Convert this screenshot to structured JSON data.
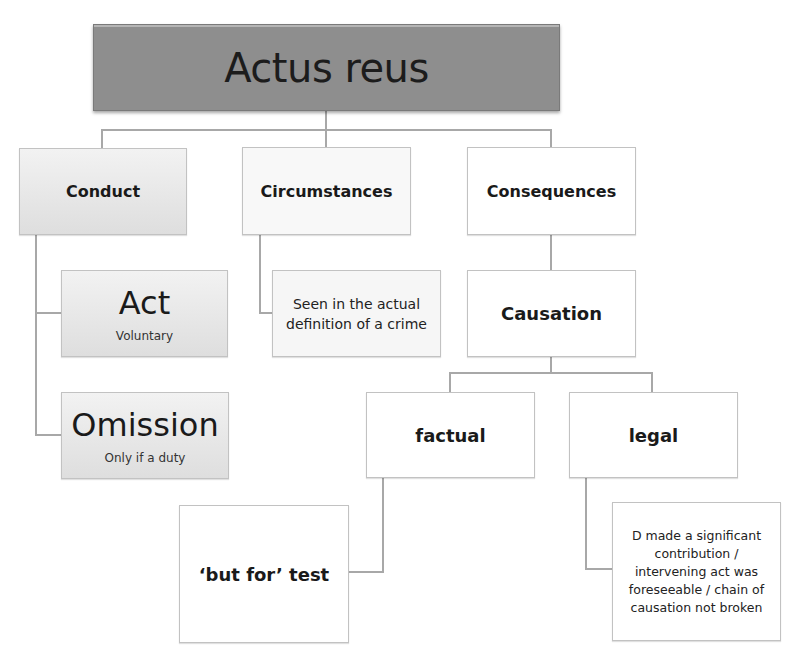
{
  "title": "Actus reus",
  "level1": {
    "conduct": "Conduct",
    "circumstances": "Circumstances",
    "consequences": "Consequences"
  },
  "conduct_children": {
    "act": {
      "label": "Act",
      "note": "Voluntary"
    },
    "omission": {
      "label": "Omission",
      "note": "Only if a duty"
    }
  },
  "circumstances_child": "Seen in the actual definition of a crime",
  "consequences_child": "Causation",
  "causation_children": {
    "factual": "factual",
    "legal": "legal"
  },
  "factual_child": "‘but for’ test",
  "legal_child": "D made a significant contribution / intervening act was foreseeable / chain of causation not broken",
  "colors": {
    "title_fill": "#8e8e8e",
    "shaded_fill": "#e6e6e6",
    "connector": "#a8a8a8"
  }
}
